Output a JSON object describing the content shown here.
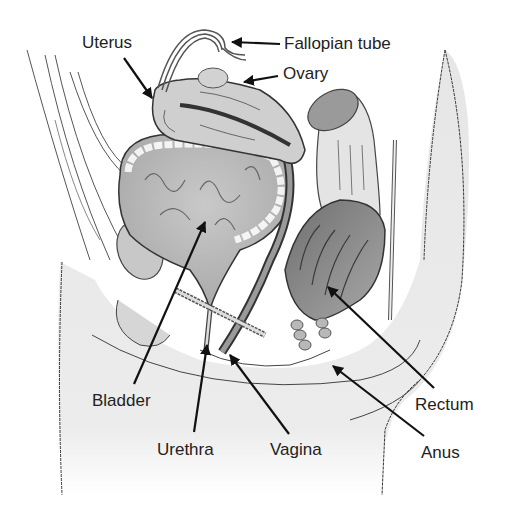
{
  "diagram": {
    "labels": [
      {
        "id": "uterus",
        "text": "Uterus",
        "x": 82,
        "y": 34,
        "arrow_from": [
          124,
          58
        ],
        "arrow_to": [
          152,
          98
        ]
      },
      {
        "id": "fallopian-tube",
        "text": "Fallopian tube",
        "x": 284,
        "y": 35,
        "arrow_from": [
          280,
          44
        ],
        "arrow_to": [
          232,
          42
        ]
      },
      {
        "id": "ovary",
        "text": "Ovary",
        "x": 283,
        "y": 65,
        "arrow_from": [
          278,
          76
        ],
        "arrow_to": [
          244,
          82
        ]
      },
      {
        "id": "bladder",
        "text": "Bladder",
        "x": 92,
        "y": 392,
        "arrow_from": [
          134,
          384
        ],
        "arrow_to": [
          205,
          222
        ]
      },
      {
        "id": "urethra",
        "text": "Urethra",
        "x": 157,
        "y": 441,
        "arrow_from": [
          194,
          432
        ],
        "arrow_to": [
          207,
          345
        ]
      },
      {
        "id": "vagina",
        "text": "Vagina",
        "x": 270,
        "y": 441,
        "arrow_from": [
          289,
          434
        ],
        "arrow_to": [
          230,
          355
        ]
      },
      {
        "id": "rectum",
        "text": "Rectum",
        "x": 415,
        "y": 396,
        "arrow_from": [
          434,
          388
        ],
        "arrow_to": [
          328,
          287
        ]
      },
      {
        "id": "anus",
        "text": "Anus",
        "x": 421,
        "y": 444,
        "arrow_from": [
          424,
          436
        ],
        "arrow_to": [
          333,
          366
        ]
      }
    ]
  },
  "colors": {
    "background": "#ffffff",
    "label_text": "#222222",
    "outline": "#444444",
    "light_fill": "#dcdcdc",
    "mid_fill": "#bdbdbd",
    "dark_fill": "#8a8a8a",
    "skin_fill": "#e8e8e8"
  }
}
